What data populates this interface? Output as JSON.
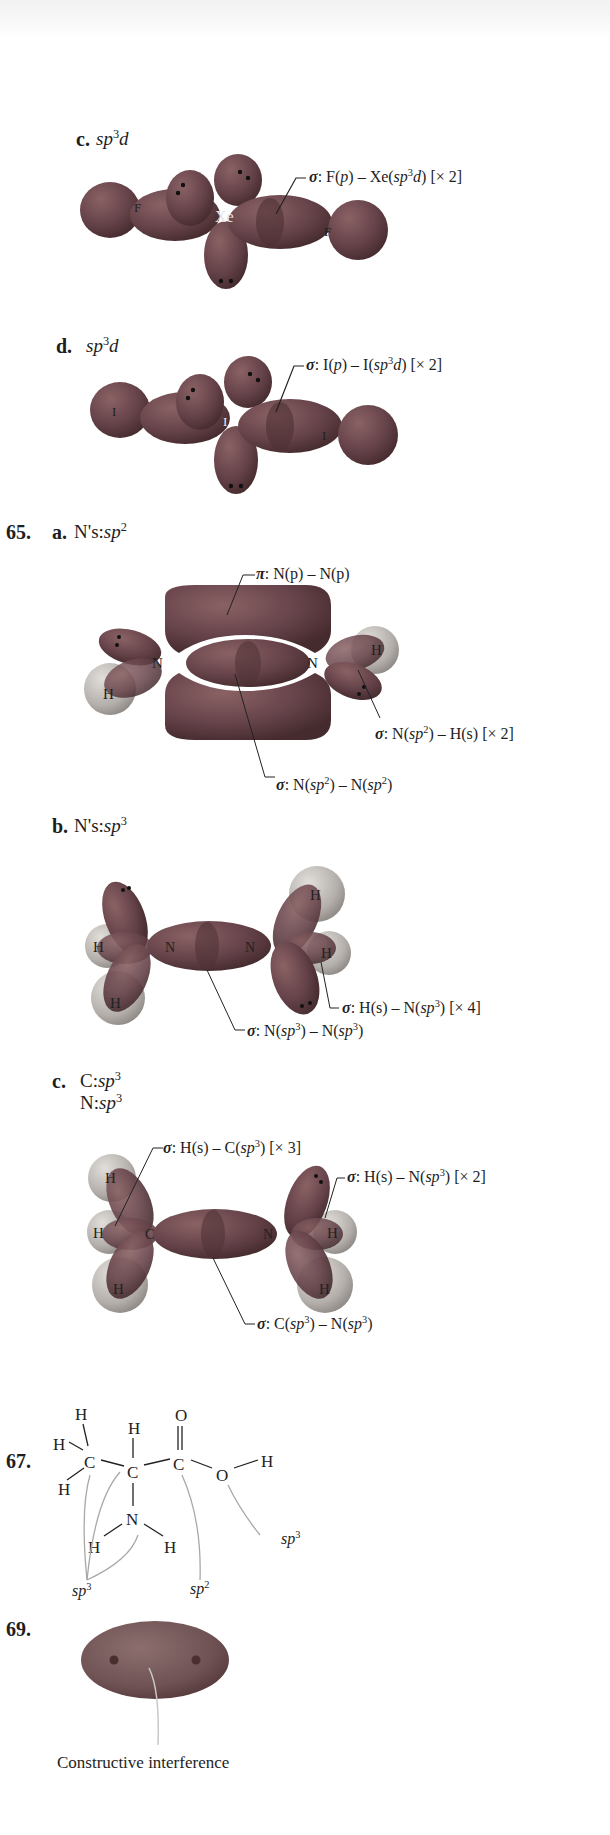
{
  "colors": {
    "lobe": "#6a4647",
    "lobe_dark": "#4a2e30",
    "lobe_light": "#8a6264",
    "h_sphere": "#b8b4b0",
    "h_sphere_light": "#dedad6",
    "leader_line": "#222222",
    "arrow_gray": "#a8a8a8",
    "text": "#1e1e1e"
  },
  "sections": {
    "c": {
      "part_label": "c.",
      "hybrid_prefix": "sp",
      "hybrid_sup": "3",
      "hybrid_suffix": "d",
      "center_atom": "Xe",
      "terminal_atoms": [
        "F",
        "F"
      ],
      "label": {
        "sigma": "σ",
        "text_a": ": F(",
        "p": "p",
        "text_b": ") – Xe(",
        "sp": "sp",
        "sup": "3",
        "d": "d",
        "text_c": ") [× 2]"
      }
    },
    "d": {
      "part_label": "d.",
      "hybrid_prefix": "sp",
      "hybrid_sup": "3",
      "hybrid_suffix": "d",
      "center_atom": "I",
      "terminal_atoms": [
        "I",
        "I"
      ],
      "label": {
        "sigma": "σ",
        "text_a": ": I(",
        "p": "p",
        "text_b": ") – I(",
        "sp": "sp",
        "sup": "3",
        "d": "d",
        "text_c": ") [× 2]"
      }
    },
    "q65": {
      "number": "65.",
      "a": {
        "part_label": "a.",
        "hybrid_prefix": "N's:",
        "hybrid_sp": "sp",
        "hybrid_sup": "2",
        "atoms": [
          "N",
          "N",
          "H",
          "H"
        ],
        "labels": {
          "pi": {
            "sym": "π",
            "text": ": N(p) – N(p)"
          },
          "sigma_nh": {
            "sym": "σ",
            "text_a": ": N(",
            "sp": "sp",
            "sup": "2",
            "text_b": ") – H(s) [× 2]"
          },
          "sigma_nn": {
            "sym": "σ",
            "text_a": ": N(",
            "sp": "sp",
            "sup": "2",
            "text_b": ") – N(",
            "sp2": "sp",
            "sup2": "2",
            "text_c": ")"
          }
        }
      },
      "b": {
        "part_label": "b.",
        "hybrid_prefix": "N's:",
        "hybrid_sp": "sp",
        "hybrid_sup": "3",
        "atoms": [
          "N",
          "N",
          "H",
          "H",
          "H",
          "H"
        ],
        "labels": {
          "sigma_hn": {
            "sym": "σ",
            "text_a": ": H(s) – N(",
            "sp": "sp",
            "sup": "3",
            "text_b": ") [× 4]"
          },
          "sigma_nn": {
            "sym": "σ",
            "text_a": ": N(",
            "sp": "sp",
            "sup": "3",
            "text_b": ") – N(",
            "sp2": "sp",
            "sup2": "3",
            "text_c": ")"
          }
        }
      },
      "c": {
        "part_label": "c.",
        "line1_prefix": "C:",
        "line2_prefix": "N:",
        "hybrid_sp": "sp",
        "hybrid_sup": "3",
        "atoms": [
          "C",
          "N",
          "H",
          "H",
          "H",
          "H",
          "H"
        ],
        "labels": {
          "sigma_hc": {
            "sym": "σ",
            "text_a": ": H(s) – C(",
            "sp": "sp",
            "sup": "3",
            "text_b": ") [× 3]"
          },
          "sigma_hn": {
            "sym": "σ",
            "text_a": ": H(s) – N(",
            "sp": "sp",
            "sup": "3",
            "text_b": ") [× 2]"
          },
          "sigma_cn": {
            "sym": "σ",
            "text_a": ": C(",
            "sp": "sp",
            "sup": "3",
            "text_b": ") – N(",
            "sp2": "sp",
            "sup2": "3",
            "text_c": ")"
          }
        }
      }
    },
    "q67": {
      "number": "67.",
      "atoms": {
        "H": "H",
        "C": "C",
        "O": "O",
        "N": "N"
      },
      "annotations": [
        {
          "sp": "sp",
          "sup": "3",
          "target": "CH3 carbon, alpha carbon, N"
        },
        {
          "sp": "sp",
          "sup": "2",
          "target": "carbonyl carbon"
        },
        {
          "sp": "sp",
          "sup": "3",
          "target": "hydroxyl O"
        }
      ]
    },
    "q69": {
      "number": "69.",
      "caption": "Constructive interference"
    }
  }
}
